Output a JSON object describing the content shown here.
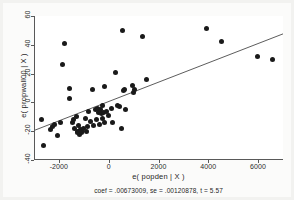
{
  "figure": {
    "caption": "coef = .00673009, se = .00120878, t = 5.57",
    "background_color": "#fbfbfa",
    "plot_background_color": "#ffffff",
    "axis_color": "#595959",
    "marker_color": "#1a1a1a",
    "line_color": "#4a4a4a"
  },
  "chart_data": {
    "type": "scatter",
    "title": "",
    "subtitle": "",
    "xlabel": "e( popden | X )",
    "ylabel": "e( propwall00 | X )",
    "annotation": "coef = .00673009, se = .00120878, t = 5.57",
    "xlim": [
      -3000,
      7000
    ],
    "ylim": [
      -40,
      60
    ],
    "xticks": [
      -2000,
      0,
      2000,
      4000,
      6000
    ],
    "xticklabels": [
      "-2000",
      "0",
      "2000",
      "4000",
      "6000"
    ],
    "yticks": [
      -40,
      -20,
      0,
      20,
      40,
      60
    ],
    "yticklabels": [
      "-40",
      "-20",
      "0",
      "20",
      "40",
      "60"
    ],
    "grid": false,
    "legend": null,
    "series": [
      {
        "name": "partial residuals",
        "type": "scatter",
        "marker": "filled-circle",
        "color": "#1a1a1a",
        "points": [
          [
            -2720,
            -12
          ],
          [
            -2640,
            -30
          ],
          [
            -2380,
            -19
          ],
          [
            -2300,
            -17
          ],
          [
            -2230,
            -15
          ],
          [
            -2090,
            -23
          ],
          [
            -1980,
            -14
          ],
          [
            -1910,
            26
          ],
          [
            -1800,
            41
          ],
          [
            -1620,
            10
          ],
          [
            -1600,
            3
          ],
          [
            -1510,
            -14
          ],
          [
            -1440,
            -12
          ],
          [
            -1400,
            -18
          ],
          [
            -1330,
            -10
          ],
          [
            -1310,
            -20
          ],
          [
            -1280,
            -21
          ],
          [
            -1260,
            -16
          ],
          [
            -1230,
            -22
          ],
          [
            -1180,
            -19
          ],
          [
            -1150,
            -21
          ],
          [
            -1120,
            -20
          ],
          [
            -1060,
            -18
          ],
          [
            -980,
            -11
          ],
          [
            -930,
            -20
          ],
          [
            -880,
            -17
          ],
          [
            -860,
            -6
          ],
          [
            -760,
            -13
          ],
          [
            -700,
            9
          ],
          [
            -640,
            -16
          ],
          [
            -560,
            -5
          ],
          [
            -520,
            -12
          ],
          [
            -470,
            -4
          ],
          [
            -440,
            -7
          ],
          [
            -420,
            -15
          ],
          [
            -380,
            -5
          ],
          [
            -330,
            -8
          ],
          [
            -300,
            -11
          ],
          [
            -270,
            -2
          ],
          [
            -250,
            -7
          ],
          [
            -200,
            11
          ],
          [
            -190,
            -14
          ],
          [
            -120,
            -6
          ],
          [
            -60,
            -9
          ],
          [
            60,
            -4
          ],
          [
            130,
            -14
          ],
          [
            220,
            21
          ],
          [
            330,
            -2
          ],
          [
            380,
            -3
          ],
          [
            470,
            -18
          ],
          [
            530,
            50
          ],
          [
            560,
            8
          ],
          [
            610,
            9
          ],
          [
            640,
            -5
          ],
          [
            900,
            12
          ],
          [
            960,
            7
          ],
          [
            1000,
            9
          ],
          [
            1330,
            46
          ],
          [
            1480,
            16
          ],
          [
            3900,
            51
          ],
          [
            4500,
            42
          ],
          [
            5950,
            32
          ],
          [
            6550,
            30
          ]
        ]
      },
      {
        "name": "fitted line",
        "type": "line",
        "color": "#4a4a4a",
        "slope": 0.00673009,
        "intercept": 0.4,
        "x_range": [
          -3000,
          7000
        ],
        "y_range": [
          -19.8,
          47.5
        ]
      }
    ]
  },
  "axes": {
    "x_title": "e( popden | X )",
    "y_title": "e( propwall00 | X )",
    "x_ticklabels": [
      "-2000",
      "0",
      "2000",
      "4000",
      "6000"
    ],
    "y_ticklabels": [
      "60",
      "40",
      "20",
      "0",
      "-20",
      "-40"
    ]
  }
}
